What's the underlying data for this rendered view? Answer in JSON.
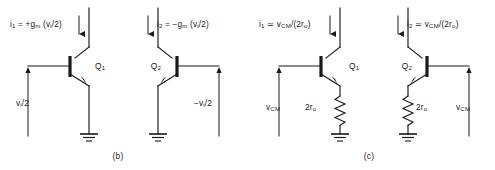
{
  "figure": {
    "background_color": "#ffffff",
    "line_color": "#1a1a1a",
    "panels": [
      {
        "id": "panel-b",
        "caption": "(b)",
        "subcircuits": [
          {
            "id": "b-left",
            "device_label": "Q",
            "device_label_sub": "1",
            "current_label": {
              "symbol": "i",
              "symbol_sub": "1",
              "relation": "=",
              "expression": "+g",
              "expression_sub": "m",
              "expression_tail": " (v",
              "expression_tail_sub": "i",
              "expression_end": "/2)"
            },
            "source_label": {
              "symbol": "v",
              "symbol_sub": "i",
              "tail": "/2"
            },
            "emitter_element": "ground",
            "orientation": "base-left"
          },
          {
            "id": "b-right",
            "device_label": "Q",
            "device_label_sub": "2",
            "current_label": {
              "symbol": "i",
              "symbol_sub": "2",
              "relation": "=",
              "expression": "−g",
              "expression_sub": "m",
              "expression_tail": " (v",
              "expression_tail_sub": "i",
              "expression_end": "/2)"
            },
            "source_label": {
              "symbol": "−v",
              "symbol_sub": "i",
              "tail": "/2"
            },
            "emitter_element": "ground",
            "orientation": "base-right"
          }
        ]
      },
      {
        "id": "panel-c",
        "caption": "(c)",
        "subcircuits": [
          {
            "id": "c-left",
            "device_label": "Q",
            "device_label_sub": "1",
            "current_label": {
              "symbol": "i",
              "symbol_sub": "1",
              "relation": "≃",
              "expression": "v",
              "expression_sub": "CM",
              "expression_end": "/(2r",
              "expression_end_sub": "o",
              "expression_close": ")"
            },
            "source_label": {
              "symbol": "v",
              "symbol_sub": "CM",
              "tail": ""
            },
            "resistor_label": {
              "value": "2r",
              "value_sub": "o"
            },
            "emitter_element": "resistor-to-ground",
            "orientation": "base-left"
          },
          {
            "id": "c-right",
            "device_label": "Q",
            "device_label_sub": "2",
            "current_label": {
              "symbol": "i",
              "symbol_sub": "2",
              "relation": "≃",
              "expression": "v",
              "expression_sub": "CM",
              "expression_end": "/(2r",
              "expression_end_sub": "o",
              "expression_close": ")"
            },
            "source_label": {
              "symbol": "v",
              "symbol_sub": "CM",
              "tail": ""
            },
            "resistor_label": {
              "value": "2r",
              "value_sub": "o"
            },
            "emitter_element": "resistor-to-ground",
            "orientation": "base-right"
          }
        ]
      }
    ]
  }
}
